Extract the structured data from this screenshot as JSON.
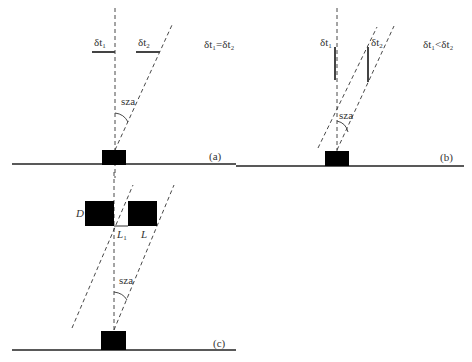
{
  "panels": {
    "a": {
      "label": "(a)",
      "delta1": "δt",
      "delta1_sub": "1",
      "delta2": "δt",
      "delta2_sub": "2",
      "relation": "δt₁=δt₂",
      "angle_label": "sza"
    },
    "b": {
      "label": "(b)",
      "delta1": "δt",
      "delta1_sub": "1",
      "delta2": "δt",
      "delta2_sub": "2",
      "relation": "δt₁<δt₂",
      "angle_label": "sza"
    },
    "c": {
      "label": "(c)",
      "d_label": "D",
      "l1_label": "L",
      "l1_sub": "1",
      "l_label": "L",
      "angle_label": "sza"
    }
  },
  "colors": {
    "line": "#222222",
    "fill": "#000000",
    "text": "#333333"
  }
}
